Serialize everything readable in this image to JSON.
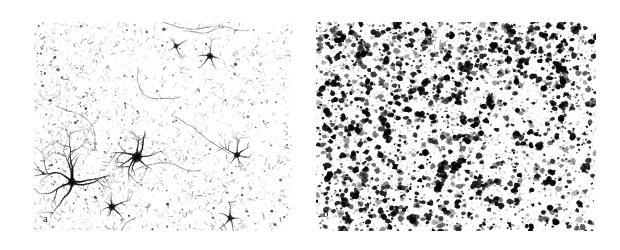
{
  "figure": {
    "kind": "photomicrograph-figure",
    "background_color": "#ffffff",
    "width": 620,
    "height": 250,
    "caption_labels_present": true
  },
  "panels": [
    {
      "id": "a",
      "label": "a",
      "name": "panel-a",
      "position": {
        "x": 34,
        "y": 22,
        "width": 258,
        "height": 209
      },
      "description": "sparse immunostained section with fine gray stippling and isolated darkly-stained stellate cells",
      "background_color": "#ffffff",
      "stipple_color": "#8a8a8a",
      "cell_color": "#101010",
      "density": "low",
      "texture": {
        "dash_count": 2600,
        "dash_min_length": 1.0,
        "dash_max_length": 4.6,
        "dash_opacity_min": 0.1,
        "dash_opacity_max": 0.62,
        "dot_count": 900,
        "dot_min_radius": 0.35,
        "dot_max_radius": 1.35
      },
      "stellate_cells": [
        {
          "cx": 38,
          "cy": 160,
          "soma_r": 3.4,
          "processes": 7,
          "reach": 46,
          "weight": 1.5,
          "darkness": 0.96
        },
        {
          "cx": 103,
          "cy": 135,
          "soma_r": 4.2,
          "processes": 8,
          "reach": 30,
          "weight": 1.5,
          "darkness": 0.97
        },
        {
          "cx": 176,
          "cy": 34,
          "soma_r": 2.6,
          "processes": 5,
          "reach": 14,
          "weight": 1.1,
          "darkness": 0.85
        },
        {
          "cx": 203,
          "cy": 133,
          "soma_r": 2.4,
          "processes": 6,
          "reach": 19,
          "weight": 1.1,
          "darkness": 0.88
        },
        {
          "cx": 78,
          "cy": 185,
          "soma_r": 2.8,
          "processes": 6,
          "reach": 17,
          "weight": 1.2,
          "darkness": 0.9
        },
        {
          "cx": 196,
          "cy": 196,
          "soma_r": 2.2,
          "processes": 5,
          "reach": 16,
          "weight": 1.1,
          "darkness": 0.84
        },
        {
          "cx": 142,
          "cy": 24,
          "soma_r": 2.0,
          "processes": 4,
          "reach": 12,
          "weight": 1.0,
          "darkness": 0.72
        }
      ],
      "gradient_note": "slightly denser stipple along left and top margins, fading toward upper-right"
    },
    {
      "id": "b",
      "label": "b",
      "name": "panel-b",
      "position": {
        "x": 316,
        "y": 22,
        "width": 280,
        "height": 209
      },
      "description": "densely immunoreactive section packed with dark punctate cell bodies",
      "background_color": "#ffffff",
      "stipple_color": "#707070",
      "cell_color": "#0a0a0a",
      "density": "high",
      "texture": {
        "blob_count": 2300,
        "blob_min_radius": 0.9,
        "blob_max_radius": 3.6,
        "blob_opacity_min": 0.3,
        "blob_opacity_max": 1.0,
        "haze_count": 2600,
        "haze_min_radius": 0.4,
        "haze_max_radius": 1.5
      },
      "gradient_note": "highest blob density in upper-left quadrant, thinning toward lower-right corner"
    }
  ],
  "colors": {
    "page_background": "#ffffff",
    "label_text": "#1a1a1a",
    "stain_dark": "#0a0a0a",
    "stain_mid": "#707070",
    "stain_light": "#b4b4b4"
  }
}
